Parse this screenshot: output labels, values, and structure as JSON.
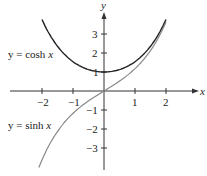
{
  "chart_data": {
    "type": "line",
    "title": "",
    "xlabel": "x",
    "ylabel": "y",
    "xlim": [
      -3.1,
      3.0
    ],
    "ylim": [
      -4.1,
      4.7
    ],
    "grid": false,
    "legend": "inline labels",
    "x_ticks": [
      -2,
      -1,
      1,
      2
    ],
    "x_tick_labels": [
      "−2",
      "−1",
      "1",
      "2"
    ],
    "y_ticks": [
      3,
      2,
      1,
      -1,
      -2,
      -3
    ],
    "y_tick_labels": [
      "3",
      "2",
      "1",
      "−1",
      "−2",
      "−3"
    ],
    "series": [
      {
        "name": "y = cosh x",
        "color": "#222222",
        "x": [
          -2.0,
          -1.5,
          -1.0,
          -0.5,
          0,
          0.5,
          1.0,
          1.5,
          2.0
        ],
        "values": [
          3.76,
          2.35,
          1.54,
          1.13,
          1.0,
          1.13,
          1.54,
          2.35,
          3.76
        ]
      },
      {
        "name": "y = sinh x",
        "color": "#888888",
        "x": [
          -2.1,
          -1.5,
          -1.0,
          -0.5,
          0,
          0.5,
          1.0,
          1.5,
          2.0
        ],
        "values": [
          -4.02,
          -2.13,
          -1.18,
          -0.52,
          0,
          0.52,
          1.18,
          2.13,
          3.63
        ]
      }
    ],
    "annotations": [
      "y = cosh x",
      "y = sinh x"
    ]
  },
  "labels": {
    "x_axis": "x",
    "y_axis": "y",
    "cosh_prefix": "y = cosh ",
    "cosh_var": "x",
    "sinh_prefix": "y = sinh ",
    "sinh_var": "x",
    "xt": [
      "−2",
      "−1",
      "1",
      "2"
    ],
    "yt": [
      "3",
      "2",
      "1",
      "−1",
      "−2",
      "−3"
    ]
  }
}
